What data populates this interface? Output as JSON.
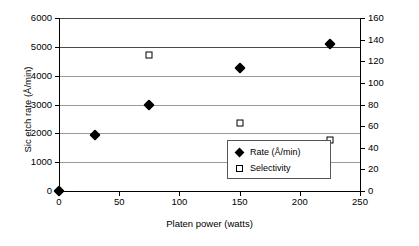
{
  "chart_data": {
    "type": "scatter",
    "title": "",
    "xlabel": "Platen power (watts)",
    "ylabel": "Sic etch rate (Å/min)",
    "y2label": "Selectivity to mask",
    "xlim": [
      0,
      250
    ],
    "ylim": [
      0,
      6000
    ],
    "y2lim": [
      0,
      160
    ],
    "xticks": [
      "0",
      "50",
      "100",
      "150",
      "200",
      "250"
    ],
    "yticks": [
      "0",
      "1000",
      "2000",
      "3000",
      "4000",
      "5000",
      "6000"
    ],
    "y2ticks": [
      "0",
      "20",
      "40",
      "60",
      "80",
      "100",
      "120",
      "140",
      "160"
    ],
    "grid": true,
    "legend_position": "inside-lower-right",
    "series": [
      {
        "name": "Rate (Å/min)",
        "marker": "filled-diamond",
        "axis": "left",
        "points": [
          {
            "x": 0,
            "y": 0
          },
          {
            "x": 30,
            "y": 1950
          },
          {
            "x": 75,
            "y": 3000
          },
          {
            "x": 150,
            "y": 4280
          },
          {
            "x": 225,
            "y": 5090
          }
        ]
      },
      {
        "name": "Selectivity",
        "marker": "open-square",
        "axis": "right",
        "points": [
          {
            "x": 75,
            "y": 126
          },
          {
            "x": 150,
            "y": 63
          },
          {
            "x": 225,
            "y": 47
          }
        ]
      }
    ]
  },
  "legend": {
    "items": [
      {
        "label": "Rate (Å/min)",
        "marker": "filled-diamond"
      },
      {
        "label": "Selectivity",
        "marker": "open-square"
      }
    ]
  }
}
